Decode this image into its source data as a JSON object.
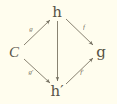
{
  "figure": {
    "kind": "commutative-diagram",
    "background_color": "#fffdee",
    "ink_color": "#4a4436",
    "width": 117,
    "height": 104
  },
  "nodes": [
    {
      "id": "C",
      "label": "C",
      "prime": "",
      "x": 14,
      "y": 52,
      "style": "italic"
    },
    {
      "id": "h",
      "label": "h",
      "prime": "",
      "x": 57,
      "y": 12,
      "style": "fraktur"
    },
    {
      "id": "g",
      "label": "g",
      "prime": "",
      "x": 101,
      "y": 52,
      "style": "fraktur"
    },
    {
      "id": "h-prime",
      "label": "h",
      "prime": "′",
      "x": 57,
      "y": 91,
      "style": "fraktur"
    }
  ],
  "edges": [
    {
      "id": "C-to-h",
      "from": "C",
      "to": "h",
      "label": "g",
      "prime": "",
      "label_x": 31,
      "label_y": 29
    },
    {
      "id": "C-to-h-prime",
      "from": "C",
      "to": "h-prime",
      "label": "g",
      "prime": "′",
      "label_x": 31,
      "label_y": 72
    },
    {
      "id": "h-to-g",
      "from": "h",
      "to": "g",
      "label": "f",
      "prime": "",
      "label_x": 84,
      "label_y": 27
    },
    {
      "id": "h-prime-to-g",
      "from": "h-prime",
      "to": "g",
      "label": "f",
      "prime": "′",
      "label_x": 82,
      "label_y": 72
    },
    {
      "id": "h-to-h-prime",
      "from": "h",
      "to": "h-prime",
      "label": "",
      "prime": "",
      "label_x": 0,
      "label_y": 0
    }
  ]
}
